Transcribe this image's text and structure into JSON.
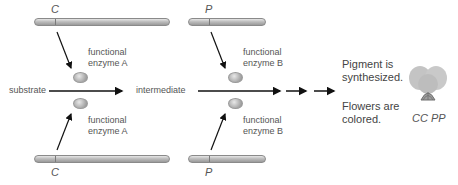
{
  "genes": {
    "top_left": "C",
    "bottom_left": "C",
    "top_right": "P",
    "bottom_right": "P"
  },
  "enzymes": {
    "a_top": {
      "line1": "functional",
      "line2": "enzyme A"
    },
    "a_bottom": {
      "line1": "functional",
      "line2": "enzyme A"
    },
    "b_top": {
      "line1": "functional",
      "line2": "enzyme B"
    },
    "b_bottom": {
      "line1": "functional",
      "line2": "enzyme B"
    }
  },
  "pathway": {
    "substrate": "substrate",
    "intermediate": "intermediate"
  },
  "outcome": {
    "pigment_line1": "Pigment is",
    "pigment_line2": "synthesized.",
    "flowers_line1": "Flowers are",
    "flowers_line2": "colored."
  },
  "genotype": "CC PP",
  "colors": {
    "chromosome": "#b5b5b5",
    "enzyme": "#a8a8a8",
    "arrow": "#111111",
    "flower": "#c7c7c7"
  }
}
